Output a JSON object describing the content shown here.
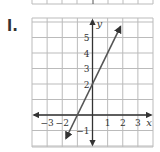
{
  "problem_label": "l.",
  "chart_data": {
    "type": "line",
    "title": "",
    "xlabel": "x",
    "ylabel": "y",
    "xlim": [
      -4,
      4
    ],
    "ylim": [
      -2,
      6
    ],
    "grid": true,
    "x_tick_labels": [
      "-3",
      "-2",
      "1",
      "2",
      "3"
    ],
    "y_tick_labels": [
      "5",
      "4",
      "3",
      "2",
      "-1"
    ],
    "series": [
      {
        "name": "y = 2x + 2",
        "equation": "y = 2x + 2",
        "slope": 2,
        "intercept": 2,
        "x": [
          -1.75,
          1.85
        ],
        "y": [
          -1.5,
          5.7
        ],
        "arrows": "both"
      }
    ],
    "points_of_interest": [
      {
        "label": "x-intercept",
        "x": -1,
        "y": 0
      },
      {
        "label": "y-intercept",
        "x": 0,
        "y": 2
      }
    ]
  },
  "colors": {
    "grid": "#bbbbbb",
    "axis": "#333333",
    "line": "#555555"
  }
}
